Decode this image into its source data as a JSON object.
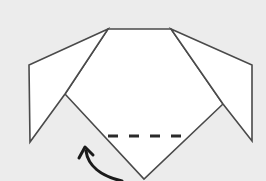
{
  "diagram": {
    "type": "origami-fold-step",
    "colors": {
      "background": "#ececec",
      "paper": "#ffffff",
      "line": "#4a4a4a",
      "fold_line": "#2a2a2a",
      "arrow": "#1a1a1a"
    },
    "elements": [
      {
        "name": "head",
        "shape": "polygon",
        "points": "108,29 171,29 223,104 144,179 65,94"
      },
      {
        "name": "left-ear",
        "shape": "polygon",
        "points": "108,29 29,65 30,142 65,94"
      },
      {
        "name": "right-ear",
        "shape": "polygon",
        "points": "171,29 252,65 252,141 223,104"
      },
      {
        "name": "valley-fold-line",
        "style": "dashed",
        "from": [
          108,
          136
        ],
        "to": [
          184,
          136
        ]
      },
      {
        "name": "fold-up-arrow",
        "style": "curved-arrow",
        "direction": "up"
      }
    ]
  }
}
